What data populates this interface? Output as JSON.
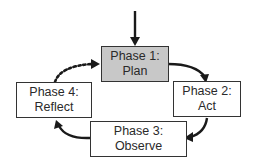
{
  "diagram": {
    "type": "cycle",
    "entry_arrow": "down-into-phase-1",
    "colors": {
      "active_fill": "#c8c8c8",
      "box_fill": "#ffffff",
      "stroke": "#222222"
    },
    "phases": [
      {
        "id": "phase1",
        "title": "Phase 1:",
        "label": "Plan",
        "highlighted": true
      },
      {
        "id": "phase2",
        "title": "Phase 2:",
        "label": "Act",
        "highlighted": false
      },
      {
        "id": "phase3",
        "title": "Phase 3:",
        "label": "Observe",
        "highlighted": false
      },
      {
        "id": "phase4",
        "title": "Phase 4:",
        "label": "Reflect",
        "highlighted": false
      }
    ],
    "edges": [
      {
        "from": "entry",
        "to": "phase1",
        "style": "solid"
      },
      {
        "from": "phase1",
        "to": "phase2",
        "style": "solid"
      },
      {
        "from": "phase2",
        "to": "phase3",
        "style": "solid"
      },
      {
        "from": "phase3",
        "to": "phase4",
        "style": "solid"
      },
      {
        "from": "phase4",
        "to": "phase1",
        "style": "dotted"
      }
    ]
  }
}
